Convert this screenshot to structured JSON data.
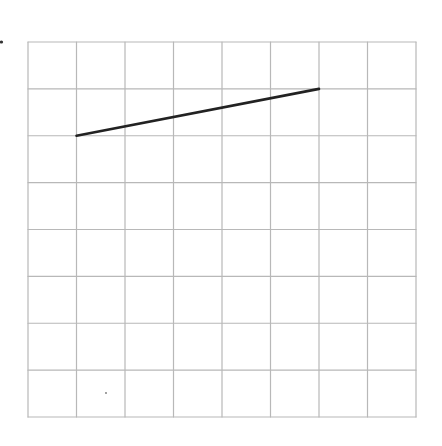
{
  "grid": {
    "cols": 8,
    "rows": 8,
    "left": 28,
    "top": 42,
    "right": 416,
    "bottom": 417,
    "line_color": "#b8b8b8",
    "line_width": 1.2
  },
  "segments": [
    {
      "from": [
        1,
        2
      ],
      "to": [
        6,
        1
      ],
      "color": "#222222",
      "width": 2.6
    }
  ],
  "marks": [
    {
      "x": 1.5,
      "y": 42,
      "r": 1.6,
      "color": "#333333"
    },
    {
      "x": 106,
      "y": 393,
      "r": 0.9,
      "color": "#777777"
    }
  ]
}
